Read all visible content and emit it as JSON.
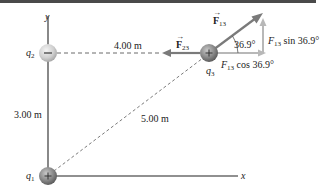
{
  "diagram": {
    "axes": {
      "x_label": "x",
      "y_label": "y"
    },
    "charges": [
      {
        "id": "q1",
        "label": "q",
        "sub": "1",
        "sign": "+",
        "position": "origin"
      },
      {
        "id": "q2",
        "label": "q",
        "sub": "2",
        "sign": "−",
        "position": "on y-axis"
      },
      {
        "id": "q3",
        "label": "q",
        "sub": "3",
        "sign": "+",
        "position": "upper right"
      }
    ],
    "distances": {
      "q2_q3": "4.00 m",
      "q1_q2": "3.00 m",
      "q1_q3": "5.00 m"
    },
    "forces": {
      "f13": {
        "symbol": "F",
        "sub": "13"
      },
      "f23": {
        "symbol": "F",
        "sub": "23"
      }
    },
    "components": {
      "angle": "36.9°",
      "vertical": {
        "symbol": "F",
        "sub": "13",
        "text": " sin 36.9°"
      },
      "horizontal": {
        "symbol": "F",
        "sub": "13",
        "text": " cos 36.9°"
      }
    },
    "colors": {
      "axis": "#6b6b6b",
      "force_arrow": "#7a7a7a",
      "component_arrow": "#b8b8b8",
      "dashed": "#6b6b6b",
      "positive_charge": "#8a8a8a",
      "negative_charge": "#d0d0d0",
      "top_bar": "#4a4a4a"
    }
  }
}
